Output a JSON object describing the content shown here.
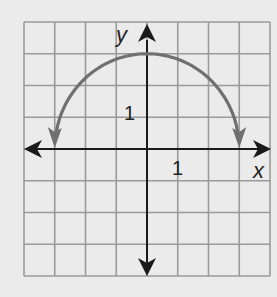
{
  "chart_data": {
    "type": "line",
    "title": "",
    "xlabel": "x",
    "ylabel": "y",
    "xlim": [
      -4,
      4
    ],
    "ylim": [
      -4,
      4
    ],
    "grid": true,
    "tick_labels": {
      "x": [
        "1"
      ],
      "y": [
        "1"
      ]
    },
    "series": [
      {
        "name": "y = sqrt(9 - x^2)",
        "equation": "y = sqrt(9 - x^2)",
        "shape": "upper semicircle, radius 3, centered at origin",
        "end_arrows": true,
        "x": [
          -3,
          -2,
          -1,
          0,
          1,
          2,
          3
        ],
        "values": [
          0,
          2.24,
          2.83,
          3,
          2.83,
          2.24,
          0
        ]
      }
    ]
  },
  "axes": {
    "x_label": "x",
    "y_label": "y",
    "x_tick": "1",
    "y_tick": "1"
  },
  "colors": {
    "background": "#ebebeb",
    "grid": "#9a9a9a",
    "axis": "#1a1a1a",
    "curve": "#707070"
  }
}
